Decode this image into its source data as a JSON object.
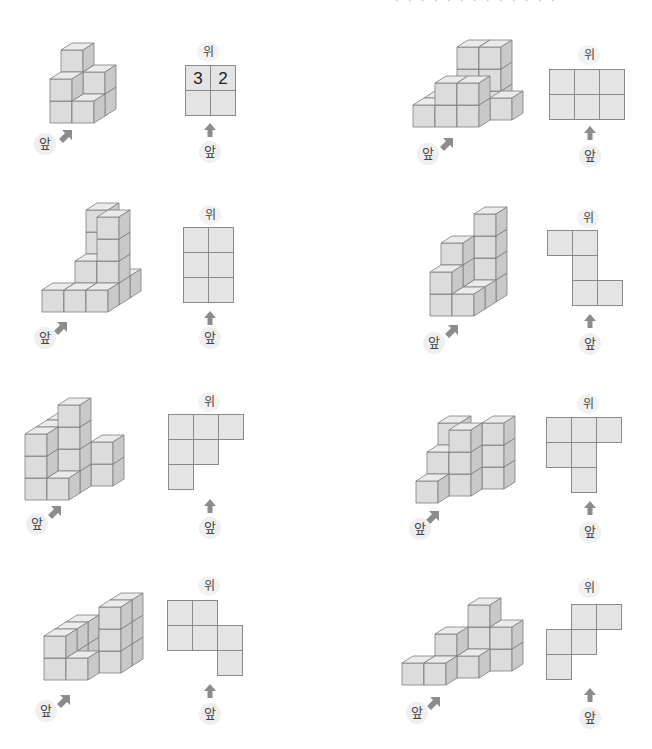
{
  "page": {
    "header_fragment": "· · · · · · ·  · ·  ·  ·  ·  ·"
  },
  "labels": {
    "top": "위",
    "front": "앞"
  },
  "colors": {
    "cube_front": "#dcdcdc",
    "cube_top": "#ebebeb",
    "cube_side": "#c9c9c9",
    "cube_edge": "#7d7d7d",
    "cell_fill": "#e4e4e4",
    "cell_border": "#8a8a8a",
    "arrow": "#8c8c8c"
  },
  "problems": [
    {
      "id": 1,
      "solid_origin": [
        50,
        123
      ],
      "cubes": [
        [
          0,
          1,
          0
        ],
        [
          0,
          1,
          1
        ],
        [
          0,
          1,
          2
        ],
        [
          1,
          1,
          0
        ],
        [
          1,
          1,
          1
        ],
        [
          0,
          0,
          0
        ],
        [
          0,
          0,
          1
        ],
        [
          1,
          0,
          0
        ]
      ],
      "front_label_pos": [
        34,
        133
      ],
      "front_arrow_pos": [
        57,
        127
      ],
      "top_view": {
        "title_pos": [
          197,
          42
        ],
        "grid_origin": [
          185,
          65
        ],
        "cells": [
          [
            0,
            0,
            "3"
          ],
          [
            1,
            0,
            "2"
          ],
          [
            0,
            1,
            ""
          ],
          [
            1,
            1,
            ""
          ]
        ],
        "arrow_pos": [
          203,
          122
        ],
        "front_pos": [
          199,
          141
        ]
      }
    },
    {
      "id": 2,
      "solid_origin": [
        413,
        127
      ],
      "cubes": [
        [
          1,
          2,
          0
        ],
        [
          1,
          2,
          1
        ],
        [
          1,
          2,
          2
        ],
        [
          2,
          2,
          0
        ],
        [
          2,
          2,
          1
        ],
        [
          2,
          2,
          2
        ],
        [
          0,
          1,
          0
        ],
        [
          3,
          1,
          0
        ],
        [
          0,
          0,
          0
        ],
        [
          1,
          0,
          0
        ],
        [
          1,
          0,
          1
        ],
        [
          2,
          0,
          0
        ],
        [
          2,
          0,
          1
        ]
      ],
      "front_label_pos": [
        417,
        143
      ],
      "front_arrow_pos": [
        438,
        135
      ],
      "top_view": {
        "title_pos": [
          578,
          45
        ],
        "grid_origin": [
          549,
          69
        ],
        "cells": [
          [
            0,
            0,
            ""
          ],
          [
            1,
            0,
            ""
          ],
          [
            2,
            0,
            ""
          ],
          [
            0,
            1,
            ""
          ],
          [
            1,
            1,
            ""
          ],
          [
            2,
            1,
            ""
          ]
        ],
        "arrow_pos": [
          583,
          125
        ],
        "front_pos": [
          579,
          145
        ]
      }
    },
    {
      "id": 3,
      "solid_origin": [
        42,
        312
      ],
      "cubes": [
        [
          1,
          2,
          0
        ],
        [
          1,
          2,
          1
        ],
        [
          1,
          2,
          2
        ],
        [
          1,
          2,
          3
        ],
        [
          2,
          2,
          0
        ],
        [
          1,
          1,
          0
        ],
        [
          1,
          1,
          1
        ],
        [
          2,
          1,
          0
        ],
        [
          2,
          1,
          1
        ],
        [
          2,
          1,
          2
        ],
        [
          2,
          1,
          3
        ],
        [
          0,
          0,
          0
        ],
        [
          1,
          0,
          0
        ],
        [
          2,
          0,
          0
        ]
      ],
      "front_label_pos": [
        34,
        327
      ],
      "front_arrow_pos": [
        52,
        319
      ],
      "top_view": {
        "title_pos": [
          199,
          205
        ],
        "grid_origin": [
          183,
          227
        ],
        "cells": [
          [
            0,
            0,
            ""
          ],
          [
            1,
            0,
            ""
          ],
          [
            0,
            1,
            ""
          ],
          [
            1,
            1,
            ""
          ],
          [
            0,
            2,
            ""
          ],
          [
            1,
            2,
            ""
          ]
        ],
        "arrow_pos": [
          203,
          310
        ],
        "front_pos": [
          199,
          327
        ]
      }
    },
    {
      "id": 4,
      "solid_origin": [
        430,
        316
      ],
      "cubes": [
        [
          1,
          2,
          0
        ],
        [
          1,
          2,
          1
        ],
        [
          1,
          2,
          2
        ],
        [
          1,
          2,
          3
        ],
        [
          0,
          1,
          0
        ],
        [
          0,
          1,
          1
        ],
        [
          0,
          1,
          2
        ],
        [
          1,
          1,
          0
        ],
        [
          0,
          0,
          0
        ],
        [
          0,
          0,
          1
        ],
        [
          1,
          0,
          0
        ]
      ],
      "front_label_pos": [
        423,
        332
      ],
      "front_arrow_pos": [
        443,
        322
      ],
      "top_view": {
        "title_pos": [
          577,
          208
        ],
        "grid_origin": [
          547,
          230
        ],
        "cells": [
          [
            0,
            0,
            ""
          ],
          [
            1,
            0,
            ""
          ],
          [
            1,
            1,
            ""
          ],
          [
            1,
            2,
            ""
          ],
          [
            2,
            2,
            ""
          ]
        ],
        "arrow_pos": [
          583,
          313
        ],
        "front_pos": [
          579,
          333
        ]
      }
    },
    {
      "id": 5,
      "solid_origin": [
        25,
        500
      ],
      "cubes": [
        [
          0,
          2,
          0
        ],
        [
          0,
          2,
          1
        ],
        [
          0,
          2,
          2
        ],
        [
          1,
          2,
          0
        ],
        [
          2,
          2,
          0
        ],
        [
          2,
          2,
          1
        ],
        [
          0,
          1,
          0
        ],
        [
          0,
          1,
          1
        ],
        [
          0,
          1,
          2
        ],
        [
          1,
          1,
          0
        ],
        [
          1,
          1,
          1
        ],
        [
          1,
          1,
          2
        ],
        [
          1,
          1,
          3
        ],
        [
          0,
          0,
          0
        ],
        [
          0,
          0,
          1
        ],
        [
          0,
          0,
          2
        ],
        [
          1,
          0,
          0
        ]
      ],
      "front_label_pos": [
        26,
        513
      ],
      "front_arrow_pos": [
        46,
        503
      ],
      "top_view": {
        "title_pos": [
          198,
          392
        ],
        "grid_origin": [
          168,
          414
        ],
        "cells": [
          [
            0,
            0,
            ""
          ],
          [
            1,
            0,
            ""
          ],
          [
            2,
            0,
            ""
          ],
          [
            0,
            1,
            ""
          ],
          [
            1,
            1,
            ""
          ],
          [
            0,
            2,
            ""
          ]
        ],
        "arrow_pos": [
          203,
          498
        ],
        "front_pos": [
          199,
          517
        ]
      }
    },
    {
      "id": 6,
      "solid_origin": [
        416,
        503
      ],
      "cubes": [
        [
          0,
          2,
          0
        ],
        [
          0,
          2,
          1
        ],
        [
          0,
          2,
          2
        ],
        [
          1,
          2,
          0
        ],
        [
          2,
          2,
          0
        ],
        [
          2,
          2,
          1
        ],
        [
          2,
          2,
          2
        ],
        [
          0,
          1,
          0
        ],
        [
          0,
          1,
          1
        ],
        [
          1,
          1,
          0
        ],
        [
          1,
          1,
          1
        ],
        [
          1,
          1,
          2
        ],
        [
          0,
          0,
          0
        ]
      ],
      "front_label_pos": [
        409,
        518
      ],
      "front_arrow_pos": [
        424,
        508
      ],
      "top_view": {
        "title_pos": [
          577,
          394
        ],
        "grid_origin": [
          546,
          417
        ],
        "cells": [
          [
            0,
            0,
            ""
          ],
          [
            1,
            0,
            ""
          ],
          [
            2,
            0,
            ""
          ],
          [
            0,
            1,
            ""
          ],
          [
            1,
            1,
            ""
          ],
          [
            1,
            2,
            ""
          ]
        ],
        "arrow_pos": [
          583,
          500
        ],
        "front_pos": [
          579,
          521
        ]
      }
    },
    {
      "id": 7,
      "solid_origin": [
        44,
        680
      ],
      "cubes": [
        [
          0,
          2,
          0
        ],
        [
          0,
          2,
          1
        ],
        [
          2,
          2,
          0
        ],
        [
          2,
          2,
          1
        ],
        [
          2,
          2,
          2
        ],
        [
          0,
          1,
          0
        ],
        [
          0,
          1,
          1
        ],
        [
          2,
          1,
          0
        ],
        [
          2,
          1,
          1
        ],
        [
          2,
          1,
          2
        ],
        [
          0,
          0,
          0
        ],
        [
          0,
          0,
          1
        ],
        [
          1,
          0,
          0
        ]
      ],
      "front_label_pos": [
        35,
        700
      ],
      "front_arrow_pos": [
        55,
        692
      ],
      "top_view": {
        "title_pos": [
          198,
          576
        ],
        "grid_origin": [
          167,
          600
        ],
        "cells": [
          [
            0,
            0,
            ""
          ],
          [
            1,
            0,
            ""
          ],
          [
            0,
            1,
            ""
          ],
          [
            1,
            1,
            ""
          ],
          [
            2,
            1,
            ""
          ],
          [
            2,
            2,
            ""
          ]
        ],
        "arrow_pos": [
          203,
          683
        ],
        "front_pos": [
          199,
          703
        ]
      }
    },
    {
      "id": 8,
      "solid_origin": [
        402,
        685
      ],
      "cubes": [
        [
          2,
          2,
          0
        ],
        [
          2,
          2,
          1
        ],
        [
          2,
          2,
          2
        ],
        [
          3,
          2,
          0
        ],
        [
          3,
          2,
          1
        ],
        [
          1,
          1,
          0
        ],
        [
          1,
          1,
          1
        ],
        [
          2,
          1,
          0
        ],
        [
          0,
          0,
          0
        ],
        [
          1,
          0,
          0
        ]
      ],
      "front_label_pos": [
        406,
        702
      ],
      "front_arrow_pos": [
        425,
        694
      ],
      "top_view": {
        "title_pos": [
          578,
          578
        ],
        "grid_origin": [
          546,
          604
        ],
        "cells": [
          [
            1,
            0,
            ""
          ],
          [
            2,
            0,
            ""
          ],
          [
            0,
            1,
            ""
          ],
          [
            1,
            1,
            ""
          ],
          [
            0,
            2,
            ""
          ]
        ],
        "arrow_pos": [
          583,
          687
        ],
        "front_pos": [
          579,
          707
        ]
      }
    }
  ]
}
